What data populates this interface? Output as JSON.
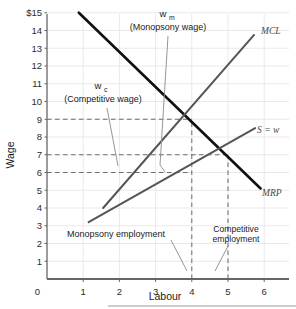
{
  "chart_data": {
    "type": "line",
    "title": "",
    "xlabel": "Labour",
    "ylabel": "Wage",
    "xlim": [
      0,
      6.6
    ],
    "ylim": [
      0,
      15.6
    ],
    "grid": true,
    "x_ticks": [
      "0",
      "1",
      "2",
      "3",
      "4",
      "5",
      "6"
    ],
    "x_tick_values": [
      0,
      1,
      2,
      3,
      4,
      5,
      6
    ],
    "y_ticks": [
      "0",
      "1",
      "2",
      "3",
      "4",
      "5",
      "6",
      "7",
      "8",
      "9",
      "10",
      "11",
      "12",
      "13",
      "14",
      "$15"
    ],
    "y_tick_values": [
      0,
      1,
      2,
      3,
      4,
      5,
      6,
      7,
      8,
      9,
      10,
      11,
      12,
      13,
      14,
      15
    ],
    "series": [
      {
        "name": "MRP",
        "label": "MRP",
        "color": "#111111",
        "width": 2.6,
        "points": [
          [
            0.88,
            15.0
          ],
          [
            5.9,
            5.1
          ]
        ]
      },
      {
        "name": "MCL",
        "label": "MCL",
        "color": "#555555",
        "width": 2.0,
        "points": [
          [
            1.55,
            4.0
          ],
          [
            5.72,
            13.75
          ]
        ]
      },
      {
        "name": "S = w",
        "label": "S = w",
        "color": "#555555",
        "width": 2.0,
        "points": [
          [
            1.15,
            3.2
          ],
          [
            5.75,
            8.5
          ]
        ]
      }
    ],
    "markers": {
      "monopsony_wage": 6,
      "competitive_wage": 7,
      "mrp_at_monopsony": 9,
      "monopsony_employment": 4,
      "competitive_employment": 5
    },
    "guide_lines": [
      {
        "name": "w-9-horizontal",
        "y": 9,
        "x_from": 0,
        "x_to": 4
      },
      {
        "name": "w-7-horizontal",
        "y": 7,
        "x_from": 0,
        "x_to": 5
      },
      {
        "name": "w-6-horizontal",
        "y": 6,
        "x_from": 0,
        "x_to": 4
      },
      {
        "name": "L-4-vertical",
        "x": 4,
        "y_from": 0,
        "y_to": 9
      },
      {
        "name": "L-5-vertical",
        "x": 5,
        "y_from": 0,
        "y_to": 7
      }
    ],
    "annotations": [
      {
        "name": "monopsony-wage",
        "var": "w",
        "sub": "m",
        "text": "(Monopsony wage)"
      },
      {
        "name": "competitive-wage",
        "var": "w",
        "sub": "c",
        "text": "(Competitive wage)"
      },
      {
        "name": "monopsony-employment",
        "text": "Monopsony employment"
      },
      {
        "name": "competitive-employment",
        "line1": "Competitive",
        "line2": "employment"
      }
    ]
  },
  "axes": {
    "x_title": "Labour",
    "y_title": "Wage"
  },
  "labels": {
    "mrp": "MRP",
    "mcl": "MCL",
    "s_equals_w": "S = w",
    "wm_var": "w",
    "wm_sub": "m",
    "wm_text": "(Monopsony wage)",
    "wc_var": "w",
    "wc_sub": "c",
    "wc_text": "(Competitive wage)",
    "monopsony_employment": "Monopsony employment",
    "competitive_employment_line1": "Competitive",
    "competitive_employment_line2": "employment"
  },
  "x_tick_labels": [
    "0",
    "1",
    "2",
    "3",
    "4",
    "5",
    "6"
  ],
  "y_tick_labels": [
    "1",
    "2",
    "3",
    "4",
    "5",
    "6",
    "7",
    "8",
    "9",
    "10",
    "11",
    "12",
    "13",
    "14",
    "$15"
  ],
  "y_zero_label": "0",
  "colors": {
    "mrp": "#111111",
    "mcl": "#555555",
    "supply": "#555555",
    "axis": "#666666",
    "grid": "#e9e9ec",
    "dash": "#6b6b6b",
    "text": "#1a1a1a"
  }
}
